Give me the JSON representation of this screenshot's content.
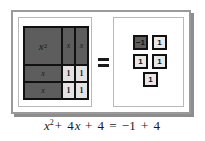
{
  "figure": {
    "kind": "algebra-tiles-model",
    "caption_equation": "x² + 4x + 4 = −1 + 4",
    "equals_symbol": "=",
    "colors": {
      "tile_dark": "#5d5d5d",
      "tile_light": "#e2e2e2",
      "tile_border": "#111111",
      "frame": "#9a9a9a",
      "panel_border": "#b9b9b9",
      "text": "#1a1a1a"
    }
  },
  "left_panel": {
    "name": "left-expression-panel",
    "grid": {
      "columns": 3,
      "rows": 3,
      "cells": [
        {
          "id": "x-squared",
          "label": "x",
          "exponent": "2",
          "shade": "dark",
          "span": "large-square"
        },
        {
          "id": "x-vertical-1",
          "label": "x",
          "shade": "dark"
        },
        {
          "id": "x-vertical-2",
          "label": "x",
          "shade": "dark"
        },
        {
          "id": "x-horizontal-1",
          "label": "x",
          "shade": "dark"
        },
        {
          "id": "unit-1",
          "label": "1",
          "shade": "light"
        },
        {
          "id": "unit-2",
          "label": "1",
          "shade": "light"
        },
        {
          "id": "x-horizontal-2",
          "label": "x",
          "shade": "dark"
        },
        {
          "id": "unit-3",
          "label": "1",
          "shade": "light"
        },
        {
          "id": "unit-4",
          "label": "1",
          "shade": "light"
        }
      ]
    }
  },
  "right_panel": {
    "name": "right-expression-panel",
    "tiles": [
      {
        "id": "neg-one",
        "label": "−1",
        "shade": "dark"
      },
      {
        "id": "pos-one-a",
        "label": "1",
        "shade": "light"
      },
      {
        "id": "pos-one-b",
        "label": "1",
        "shade": "light"
      },
      {
        "id": "pos-one-c",
        "label": "1",
        "shade": "light"
      },
      {
        "id": "pos-one-d",
        "label": "1",
        "shade": "light"
      }
    ]
  },
  "caption": {
    "lhs_var": "x",
    "lhs_exp": "2",
    "plus_1": "+",
    "lhs_term2_coef": "4",
    "lhs_term2_var": "x",
    "plus_2": "+",
    "lhs_const": "4",
    "equals": "=",
    "rhs_first": "−1",
    "plus_3": "+",
    "rhs_second": "4"
  }
}
